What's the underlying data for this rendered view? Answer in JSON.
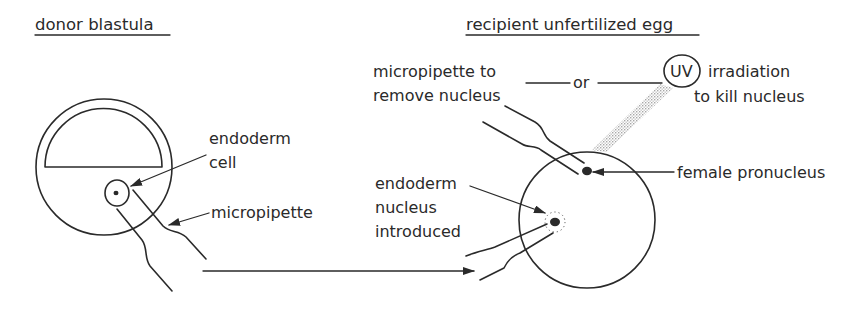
{
  "donor": {
    "title": "donor blastula",
    "labels": {
      "endoderm_cell_line1": "endoderm",
      "endoderm_cell_line2": "cell",
      "micropipette": "micropipette"
    }
  },
  "recipient": {
    "title": "recipient unfertilized egg",
    "labels": {
      "remove_line1": "micropipette to",
      "remove_line2": "remove nucleus",
      "or": "or",
      "uv": "UV",
      "uv_line1": "irradiation",
      "uv_line2": "to kill nucleus",
      "female_pronucleus": "female pronucleus",
      "introduced_line1": "endoderm",
      "introduced_line2": "nucleus",
      "introduced_line3": "introduced"
    }
  },
  "colors": {
    "ink": "#2a2a2a",
    "uv_beam": "#b8b8b8",
    "background": "#ffffff"
  }
}
